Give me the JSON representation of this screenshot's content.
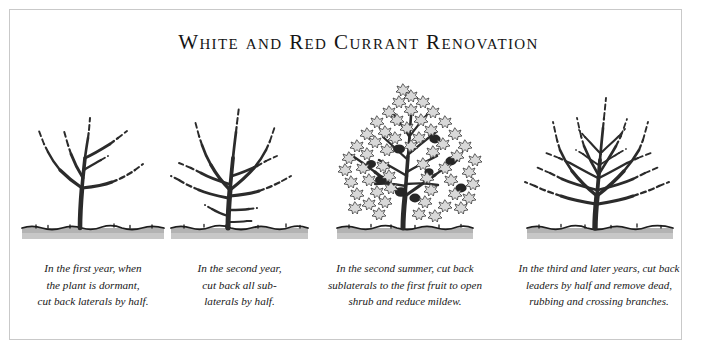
{
  "figure": {
    "title": "White and Red Currant Renovation",
    "frame_color": "#c9c9c9",
    "background_color": "#ffffff",
    "ink_color": "#2b2b2b",
    "soil_color": "#b3b3b3",
    "leaf_color": "#d8d8d8"
  },
  "panels": [
    {
      "name": "first-year-dormant",
      "stage_label": "first year",
      "caption_lines": [
        "In the first year, when",
        "the plant is dormant,",
        "cut back laterals by half."
      ]
    },
    {
      "name": "second-year-dormant",
      "stage_label": "second year",
      "caption_lines": [
        "In the second year,",
        "cut back all sub-",
        "laterals by half."
      ]
    },
    {
      "name": "second-summer-in-leaf",
      "stage_label": "second summer",
      "caption_lines": [
        "In the second summer, cut back",
        "sublaterals to the first fruit to open",
        "shrub and reduce mildew."
      ]
    },
    {
      "name": "third-and-later-years",
      "stage_label": "third and later years",
      "caption_lines": [
        "In the third and later years, cut back",
        "leaders by half and remove dead,",
        "rubbing and crossing branches."
      ]
    }
  ]
}
